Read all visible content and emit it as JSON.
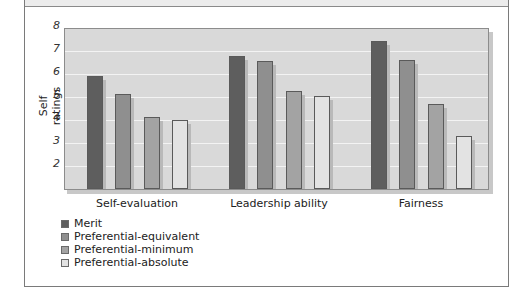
{
  "chart_data": {
    "type": "bar",
    "title": "",
    "xlabel": "",
    "ylabel": "Self ratings",
    "ylim": [
      1,
      8
    ],
    "yticks": [
      2,
      3,
      4,
      5,
      6,
      7,
      8
    ],
    "grid": true,
    "legend_position": "bottom-left",
    "categories": [
      "Self-evaluation",
      "Leadership ability",
      "Fairness"
    ],
    "series": [
      {
        "name": "Merit",
        "color": "#5e5e5e",
        "values": [
          5.9,
          6.8,
          7.45
        ]
      },
      {
        "name": "Preferential-equivalent",
        "color": "#8f8f8f",
        "values": [
          5.15,
          6.55,
          6.6
        ]
      },
      {
        "name": "Preferential-minimum",
        "color": "#a3a3a3",
        "values": [
          4.15,
          5.25,
          4.7
        ]
      },
      {
        "name": "Preferential-absolute",
        "color": "#e3e3e3",
        "values": [
          4.0,
          5.05,
          3.3
        ]
      }
    ]
  }
}
